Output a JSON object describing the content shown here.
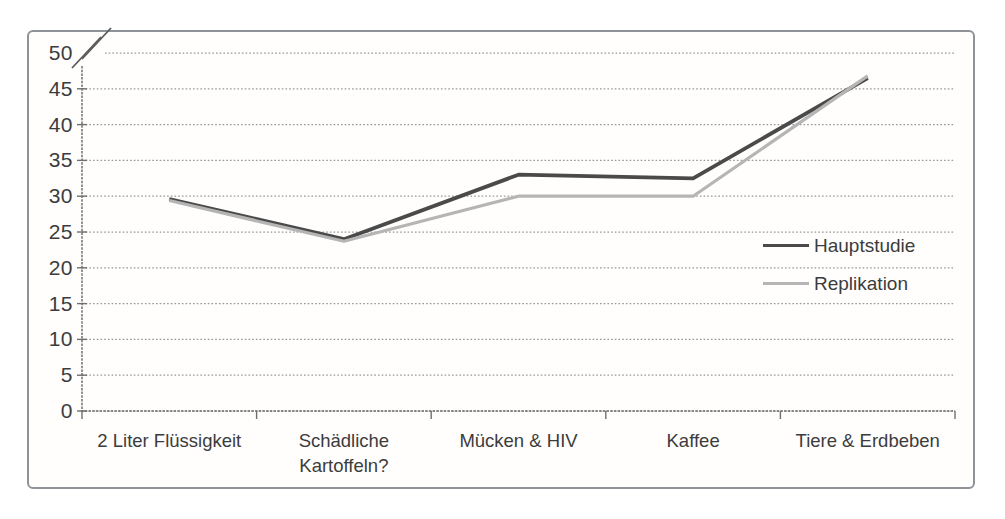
{
  "chart_data": {
    "type": "line",
    "title": "",
    "xlabel": "",
    "ylabel": "",
    "categories": [
      "2 Liter Flüssigkeit",
      "Schädliche Kartoffeln?",
      "Mücken & HIV",
      "Kaffee",
      "Tiere & Erdbeben"
    ],
    "series": [
      {
        "name": "Hauptstudie",
        "values": [
          29.6,
          24,
          33,
          32.5,
          46.5
        ],
        "color": "#4a4a4a",
        "stroke_width": 3.8
      },
      {
        "name": "Replikation",
        "values": [
          29.4,
          23.7,
          30,
          30,
          46.8
        ],
        "color": "#b5b5b5",
        "stroke_width": 3.2
      }
    ],
    "ylim": [
      0,
      50
    ],
    "yticks": [
      0,
      5,
      10,
      15,
      20,
      25,
      30,
      35,
      40,
      45,
      50
    ],
    "y_axis_break": true,
    "grid": "horizontal",
    "grid_style": "dotted",
    "legend_position": "middle-right",
    "legend_labels": [
      "Hauptstudie",
      "Replikation"
    ]
  },
  "styles": {
    "frame_border": "#8f9397",
    "grid_color": "#979797",
    "axis_color": "#6f6f6f",
    "text_color": "#3c3c3c",
    "background": "#fffefd"
  }
}
